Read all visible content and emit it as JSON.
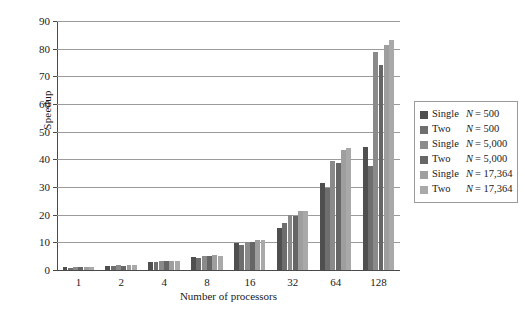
{
  "chart_data": {
    "type": "bar",
    "title": "",
    "xlabel": "Number of processors",
    "ylabel": "Speedup",
    "categories": [
      "1",
      "2",
      "4",
      "8",
      "16",
      "32",
      "64",
      "128"
    ],
    "ylim": [
      0,
      90
    ],
    "yticks": [
      0,
      10,
      20,
      30,
      40,
      50,
      60,
      70,
      80,
      90
    ],
    "grid": true,
    "legend_position": "right",
    "series": [
      {
        "name": "Single N = 500",
        "kind": "Single",
        "n": "500",
        "color": "#4f4f4f",
        "values": [
          1.0,
          1.5,
          3.0,
          4.6,
          9.6,
          15.3,
          31.5,
          44.4
        ]
      },
      {
        "name": "Two N = 500",
        "kind": "Two",
        "n": "500",
        "color": "#6e6e6e",
        "values": [
          0.9,
          1.3,
          2.8,
          4.3,
          9.2,
          17.0,
          29.7,
          37.7
        ]
      },
      {
        "name": "Single N = 5,000",
        "kind": "Single",
        "n": "5,000",
        "color": "#8a8a8a",
        "values": [
          1.0,
          1.7,
          3.2,
          5.1,
          10.3,
          20.0,
          39.5,
          78.8
        ]
      },
      {
        "name": "Two N = 5,000",
        "kind": "Two",
        "n": "5,000",
        "color": "#666666",
        "values": [
          1.0,
          1.6,
          3.1,
          4.9,
          10.1,
          19.6,
          38.6,
          74.0
        ]
      },
      {
        "name": "Single N = 17,364",
        "kind": "Single",
        "n": "17,364",
        "color": "#9e9e9e",
        "values": [
          1.0,
          1.8,
          3.4,
          5.4,
          11.0,
          21.5,
          43.4,
          81.2
        ]
      },
      {
        "name": "Two N = 17,364",
        "kind": "Two",
        "n": "17,364",
        "color": "#a9a9a9",
        "values": [
          1.0,
          1.7,
          3.3,
          5.2,
          10.7,
          21.2,
          44.2,
          83.2
        ]
      }
    ]
  }
}
